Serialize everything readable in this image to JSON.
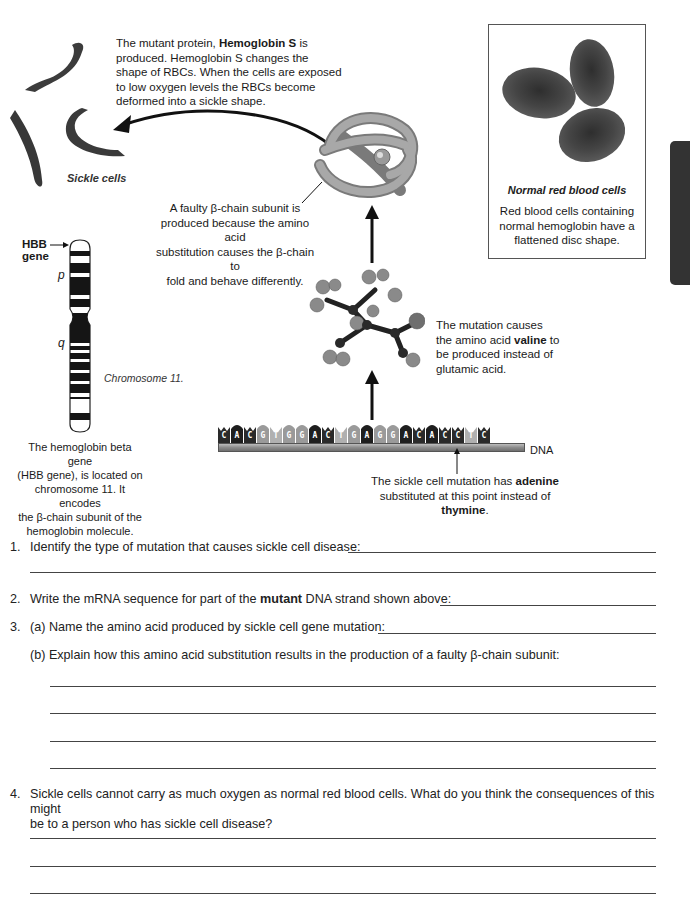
{
  "diagram": {
    "hemoglobin_s_caption": {
      "pre": "The mutant protein, ",
      "bold": "Hemoglobin S",
      "post": " is",
      "lines": [
        "produced.  Hemoglobin S changes the",
        "shape of RBCs. When the cells are exposed",
        "to low oxygen levels the RBCs become",
        "deformed into a sickle shape."
      ]
    },
    "sickle_cells_label": "Sickle cells",
    "normal_rbc": {
      "title": "Normal red blood cells",
      "lines": [
        "Red blood cells containing",
        "normal hemoglobin have a",
        "flattened disc shape."
      ]
    },
    "faulty_chain_caption": [
      "A faulty β-chain subunit is",
      "produced because the amino acid",
      "substitution causes the β-chain to",
      "fold and behave differently."
    ],
    "hbb_label": [
      "HBB",
      "gene"
    ],
    "arm_p": "p",
    "arm_q": "q",
    "chromosome_label": "Chromosome 11.",
    "hbb_caption": [
      "The hemoglobin beta gene",
      "(HBB gene), is located on",
      "chromosome 11. It encodes",
      "the β-chain subunit of the",
      "hemoglobin molecule."
    ],
    "valine_caption": {
      "line1": "The mutation causes",
      "line2_pre": "the amino acid ",
      "line2_bold": "valine",
      "line2_post": " to",
      "line3": "be produced instead of",
      "line4": "glutamic acid."
    },
    "dna_label": "DNA",
    "dna_sequence": [
      "C",
      "A",
      "C",
      "G",
      "T",
      "G",
      "G",
      "A",
      "C",
      "T",
      "G",
      "A",
      "G",
      "G",
      "A",
      "C",
      "A",
      "C",
      "C",
      "T",
      "C"
    ],
    "base_colors": {
      "A": "#1e1e1e",
      "C": "#2a2a2a",
      "G": "#9a9a9a",
      "T": "#b0b0b0"
    },
    "mutation_caption": {
      "line1_pre": "The sickle cell mutation has ",
      "line1_bold": "adenine",
      "line2_pre": "substituted at this point instead of ",
      "line2_bold": "thymine",
      "line2_post": "."
    }
  },
  "questions": {
    "q1": {
      "num": "1.",
      "text": "Identify the type of mutation that causes sickle cell disease:"
    },
    "q2": {
      "num": "2.",
      "text_pre": "Write the mRNA sequence for part of the ",
      "text_bold": "mutant",
      "text_post": " DNA strand shown above:"
    },
    "q3a": {
      "num": "3.",
      "text": "(a) Name the amino acid produced by sickle cell gene mutation:"
    },
    "q3b": {
      "text": "(b) Explain how this amino acid substitution results in the production of a faulty β-chain subunit:"
    },
    "q4": {
      "num": "4.",
      "line1": "Sickle cells cannot carry as much oxygen as normal red blood cells. What do you think the consequences of this might",
      "line2": "be to a person who has sickle cell disease?"
    }
  }
}
